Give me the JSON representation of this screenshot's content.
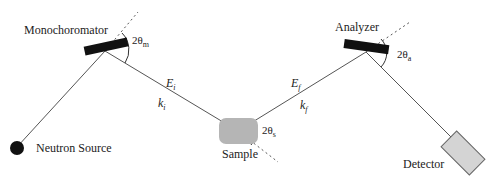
{
  "diagram": {
    "type": "triple-axis neutron spectrometer schematic",
    "colors": {
      "line": "#555555",
      "crystal": "#111111",
      "sample_fill": "#b5b5b5",
      "detector_fill": "#d4d4d4",
      "source": "#111111"
    },
    "components": {
      "source": "Neutron Source",
      "monochromator": "Monochoromator",
      "sample": "Sample",
      "analyzer": "Analyzer",
      "detector": "Detector"
    },
    "beam_labels": {
      "incident_energy": "E",
      "incident_energy_sub": "i",
      "incident_wavevector": "k",
      "incident_wavevector_sub": "i",
      "final_energy": "E",
      "final_energy_sub": "f",
      "final_wavevector": "k",
      "final_wavevector_sub": "f"
    },
    "angles": {
      "monochromator": "2θ",
      "monochromator_sub": "m",
      "sample": "2θ",
      "sample_sub": "s",
      "analyzer": "2θ",
      "analyzer_sub": "a"
    }
  }
}
